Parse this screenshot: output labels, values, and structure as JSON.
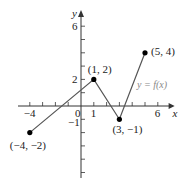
{
  "chart_data": {
    "type": "line",
    "title": "",
    "xlabel": "x",
    "ylabel": "y",
    "function_label": "y = f(x)",
    "points": [
      {
        "x": -4,
        "y": -2,
        "label": "(−4, −2)"
      },
      {
        "x": 1,
        "y": 2,
        "label": "(1, 2)"
      },
      {
        "x": 3,
        "y": -1,
        "label": "(3, −1)"
      },
      {
        "x": 5,
        "y": 4,
        "label": "(5, 4)"
      }
    ],
    "xticks": [
      -4,
      -3,
      -2,
      -1,
      0,
      1,
      2,
      3,
      4,
      5,
      6
    ],
    "xtick_labels": {
      "-4": "−4",
      "0": "0",
      "1": "1",
      "6": "6"
    },
    "yticks": [
      -5,
      -4,
      -3,
      -2,
      -1,
      1,
      2,
      3,
      4,
      5,
      6
    ],
    "ytick_labels": {
      "-1": "−1",
      "2": "2",
      "6": "6"
    },
    "xlim": [
      -4.5,
      7
    ],
    "ylim": [
      -5.5,
      7
    ],
    "grid": false,
    "colors": {
      "line": "#555555",
      "points": "#000000",
      "axes": "#333333",
      "function_label": "#888888"
    }
  }
}
